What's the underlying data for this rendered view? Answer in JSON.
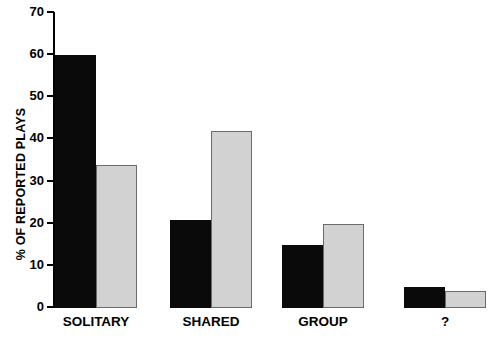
{
  "chart_data": {
    "type": "bar",
    "title": "",
    "subtitle": "",
    "xlabel": "",
    "ylabel": "% OF REPORTED PLAYS",
    "categories": [
      "SOLITARY",
      "SHARED",
      "GROUP",
      "?"
    ],
    "series": [
      {
        "name": "series-1-black",
        "color": "#0a0a0a",
        "values": [
          60,
          21,
          15,
          5
        ]
      },
      {
        "name": "series-2-gray",
        "color": "#d2d2d2",
        "values": [
          34,
          42,
          20,
          4
        ]
      }
    ],
    "ylim": [
      0,
      70
    ],
    "ytick_values": [
      0,
      10,
      20,
      30,
      40,
      50,
      60,
      70
    ],
    "ytick_labels": [
      "0",
      "10",
      "20",
      "30",
      "40",
      "50",
      "60",
      "70"
    ],
    "grid": false,
    "legend": false,
    "legend_position": "none",
    "annotations": [],
    "axis_spines": {
      "left": true,
      "bottom": false,
      "top": false,
      "right": false
    }
  },
  "colors": {
    "series_dark": "#0a0a0a",
    "series_light": "#d2d2d2",
    "axis": "#000000",
    "background": "#ffffff",
    "bar_outline": "#6b6b6b"
  }
}
